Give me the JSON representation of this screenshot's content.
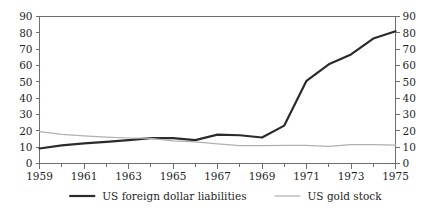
{
  "chart_data": {
    "type": "line",
    "title": "",
    "subtitle": "",
    "xlabel": "",
    "ylabel": "",
    "ylim": [
      0,
      90
    ],
    "xlim": [
      1959,
      1975
    ],
    "ytick_step": 10,
    "grid": false,
    "dual_y_axis": true,
    "legend_position": "bottom",
    "x": [
      1959,
      1960,
      1961,
      1962,
      1963,
      1964,
      1965,
      1966,
      1967,
      1968,
      1969,
      1970,
      1971,
      1972,
      1973,
      1974,
      1975
    ],
    "xticks_major": [
      "1959",
      "1961",
      "1963",
      "1965",
      "1967",
      "1969",
      "1971",
      "1973",
      "1975"
    ],
    "yticks_left": [
      "0",
      "10",
      "20",
      "30",
      "40",
      "50",
      "60",
      "70",
      "80",
      "90"
    ],
    "yticks_right": [
      "0",
      "10",
      "20",
      "30",
      "40",
      "50",
      "60",
      "70",
      "80",
      "90"
    ],
    "series": [
      {
        "name": "US foreign dollar liabilities",
        "color": "#2b2b2b",
        "width": 2.2,
        "values": [
          9.2,
          11.1,
          12.3,
          13.2,
          14.3,
          15.5,
          15.5,
          14.3,
          17.7,
          17.3,
          15.9,
          23.2,
          50.6,
          60.7,
          66.8,
          76.5,
          81.0
        ]
      },
      {
        "name": "US gold stock",
        "color": "#b0b0b0",
        "width": 1.2,
        "values": [
          19.5,
          17.8,
          16.9,
          16.1,
          15.6,
          15.4,
          13.8,
          13.2,
          12.0,
          10.9,
          11.0,
          11.1,
          11.1,
          10.5,
          11.6,
          11.6,
          11.2
        ]
      }
    ]
  },
  "legend": {
    "items": [
      {
        "label": "US foreign dollar liabilities",
        "color": "#2b2b2b",
        "width": 2.2
      },
      {
        "label": "US gold stock",
        "color": "#b0b0b0",
        "width": 1.2
      }
    ]
  }
}
